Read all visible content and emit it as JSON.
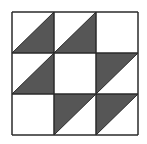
{
  "diagram": {
    "type": "3x3 triangle tile grid",
    "rows": 3,
    "cols": 3,
    "colors": {
      "dark": "#565656",
      "light": "#ffffff",
      "stroke": "#2a2a2a",
      "background": "#ffffff"
    },
    "cells": [
      [
        "dark-bottom-right",
        "dark-bottom-right",
        "blank"
      ],
      [
        "dark-bottom-right",
        "blank",
        "dark-top-left"
      ],
      [
        "blank",
        "dark-top-left",
        "dark-top-left"
      ]
    ]
  }
}
